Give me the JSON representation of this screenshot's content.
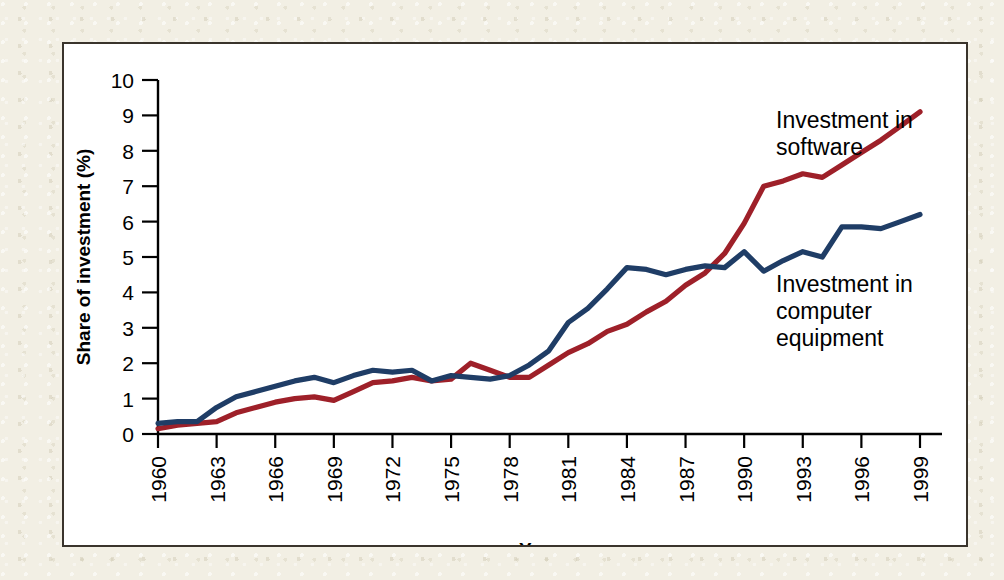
{
  "figure": {
    "panel_background": "#ffffff",
    "mat_background": "#f2efe4",
    "border_color": "#3a342c"
  },
  "chart_data": {
    "type": "line",
    "title": "",
    "xlabel": "Year",
    "ylabel": "Share of investment (%)",
    "xlim": [
      1960,
      1999
    ],
    "ylim": [
      0,
      10
    ],
    "grid": false,
    "legend_position": "inline-annotation",
    "xticks": [
      1960,
      1963,
      1966,
      1969,
      1972,
      1975,
      1978,
      1981,
      1984,
      1987,
      1990,
      1993,
      1996,
      1999
    ],
    "xtick_labels": [
      "1960",
      "1963",
      "1966",
      "1969",
      "1972",
      "1975",
      "1978",
      "1981",
      "1984",
      "1987",
      "1990",
      "1993",
      "1996",
      "1999"
    ],
    "yticks": [
      0,
      1,
      2,
      3,
      4,
      5,
      6,
      7,
      8,
      9,
      10
    ],
    "ytick_labels": [
      "0",
      "1",
      "2",
      "3",
      "4",
      "5",
      "6",
      "7",
      "8",
      "9",
      "10"
    ],
    "x": [
      1960,
      1961,
      1962,
      1963,
      1964,
      1965,
      1966,
      1967,
      1968,
      1969,
      1970,
      1971,
      1972,
      1973,
      1974,
      1975,
      1976,
      1977,
      1978,
      1979,
      1980,
      1981,
      1982,
      1983,
      1984,
      1985,
      1986,
      1987,
      1988,
      1989,
      1990,
      1991,
      1992,
      1993,
      1994,
      1995,
      1996,
      1997,
      1998,
      1999
    ],
    "series": [
      {
        "name": "Investment in software",
        "color": "#9e2029",
        "annotation": "Investment in\nsoftware",
        "values": [
          0.15,
          0.25,
          0.3,
          0.35,
          0.6,
          0.75,
          0.9,
          1.0,
          1.05,
          0.95,
          1.2,
          1.45,
          1.5,
          1.6,
          1.5,
          1.55,
          2.0,
          1.8,
          1.6,
          1.6,
          1.95,
          2.3,
          2.55,
          2.9,
          3.1,
          3.45,
          3.75,
          4.2,
          4.55,
          5.1,
          5.95,
          7.0,
          7.15,
          7.35,
          7.25,
          7.6,
          7.95,
          8.3,
          8.7,
          9.1
        ]
      },
      {
        "name": "Investment in computer equipment",
        "color": "#1f3d66",
        "annotation": "Investment in\ncomputer\nequipment",
        "values": [
          0.3,
          0.35,
          0.35,
          0.75,
          1.05,
          1.2,
          1.35,
          1.5,
          1.6,
          1.45,
          1.65,
          1.8,
          1.75,
          1.8,
          1.5,
          1.65,
          1.6,
          1.55,
          1.65,
          1.95,
          2.35,
          3.15,
          3.55,
          4.1,
          4.7,
          4.65,
          4.5,
          4.65,
          4.75,
          4.7,
          5.15,
          4.6,
          4.9,
          5.15,
          5.0,
          5.85,
          5.85,
          5.8,
          6.0,
          6.2
        ]
      }
    ],
    "annotations": [
      {
        "text_lines": [
          "Investment in",
          "software"
        ],
        "series": "Investment in software"
      },
      {
        "text_lines": [
          "Investment in",
          "computer",
          "equipment"
        ],
        "series": "Investment in computer equipment"
      }
    ]
  }
}
